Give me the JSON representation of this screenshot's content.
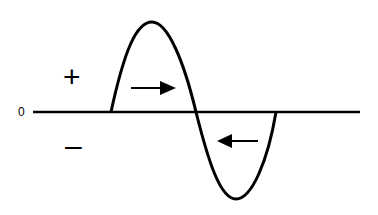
{
  "diagram": {
    "labels": {
      "zero": "0",
      "positive": "+",
      "negative": "–"
    },
    "colors": {
      "stroke": "#000000",
      "background": "#ffffff"
    },
    "baseline": {
      "x1": 33,
      "x2": 360,
      "y": 112
    },
    "positive_lobe": {
      "start_x": 111,
      "peak": [
        152,
        22
      ],
      "end_x": 196
    },
    "negative_lobe": {
      "start_x": 196,
      "trough": [
        236,
        199
      ],
      "end_x": 276
    },
    "arrows": [
      {
        "name": "right-arrow",
        "direction": "right",
        "from": [
          131,
          88
        ],
        "to": [
          176,
          88
        ]
      },
      {
        "name": "left-arrow",
        "direction": "left",
        "from": [
          258,
          141
        ],
        "to": [
          217,
          141
        ]
      }
    ]
  }
}
